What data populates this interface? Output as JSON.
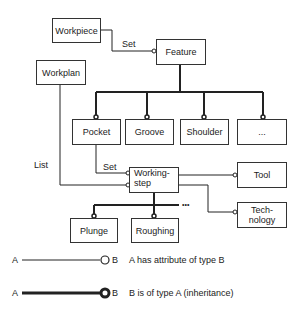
{
  "nodes": {
    "workpiece": "Workpiece",
    "feature": "Feature",
    "workplan": "Workplan",
    "pocket": "Pocket",
    "groove": "Groove",
    "shoulder": "Shoulder",
    "more_features": "...",
    "working_step_line1": "Working-",
    "working_step_line2": "step",
    "tool": "Tool",
    "technology_line1": "Tech-",
    "technology_line2": "nology",
    "plunge": "Plunge",
    "roughing": "Roughing"
  },
  "edge_labels": {
    "workpiece_feature": "Set",
    "pocket_workingstep": "Set",
    "workplan_workingstep": "List",
    "more_steps": "•••"
  },
  "legend": {
    "items": [
      {
        "from": "A",
        "to": "B",
        "style": "thin-line-small-circle",
        "text": "A has attribute of type B"
      },
      {
        "from": "A",
        "to": "B",
        "style": "thick-line-bold-circle",
        "text": "B is of type A (inheritance)"
      }
    ]
  }
}
